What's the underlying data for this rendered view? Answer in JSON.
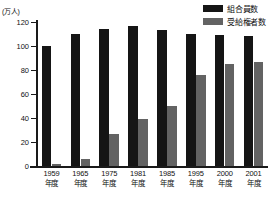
{
  "chart_data": {
    "type": "bar",
    "title": "",
    "xlabel": "",
    "ylabel": "(万人)",
    "ylim": [
      0,
      120
    ],
    "yticks": [
      0,
      20,
      40,
      60,
      80,
      100,
      120
    ],
    "grid": false,
    "legend_position": "top-right",
    "categories": [
      "1959年度",
      "1965年度",
      "1975年度",
      "1981年度",
      "1985年度",
      "1995年度",
      "2000年度",
      "2001年度"
    ],
    "category_years": [
      "1959",
      "1965",
      "1975",
      "1981",
      "1985",
      "1995",
      "2000",
      "2001"
    ],
    "category_suffix": "年度",
    "series": [
      {
        "name": "組合員数",
        "color": "#151515",
        "values": [
          100,
          110,
          114,
          117,
          113,
          110,
          109,
          108
        ]
      },
      {
        "name": "受給権者数",
        "color": "#636363",
        "values": [
          1.5,
          6,
          27,
          39,
          50,
          76,
          85,
          87
        ]
      }
    ]
  }
}
